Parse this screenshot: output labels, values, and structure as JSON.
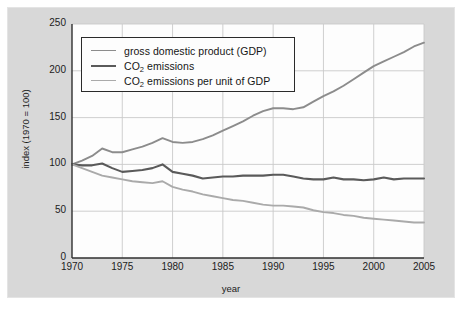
{
  "chart_data": {
    "type": "line",
    "title": "",
    "xlabel": "year",
    "ylabel": "index (1970 = 100)",
    "xlim": [
      1970,
      2005
    ],
    "ylim": [
      0,
      250
    ],
    "xticks": [
      "1970",
      "1975",
      "1980",
      "1985",
      "1990",
      "1995",
      "2000",
      "2005"
    ],
    "yticks": [
      "0",
      "50",
      "100",
      "150",
      "200",
      "250"
    ],
    "grid": true,
    "legend_position": "upper-left-inside",
    "x": [
      1970,
      1971,
      1972,
      1973,
      1974,
      1975,
      1976,
      1977,
      1978,
      1979,
      1980,
      1981,
      1982,
      1983,
      1984,
      1985,
      1986,
      1987,
      1988,
      1989,
      1990,
      1991,
      1992,
      1993,
      1994,
      1995,
      1996,
      1997,
      1998,
      1999,
      2000,
      2001,
      2002,
      2003,
      2004,
      2005
    ],
    "series": [
      {
        "name": "gross domestic product (GDP)",
        "color": "#8c8c8c",
        "values": [
          100,
          104,
          109,
          117,
          113,
          113,
          116,
          119,
          123,
          128,
          124,
          123,
          124,
          127,
          131,
          136,
          141,
          146,
          152,
          157,
          160,
          160,
          159,
          161,
          167,
          173,
          178,
          184,
          191,
          198,
          205,
          210,
          215,
          220,
          226,
          230
        ]
      },
      {
        "name": "CO₂ emissions",
        "color": "#5a5a5a",
        "values": [
          100,
          99,
          99,
          101,
          96,
          92,
          93,
          94,
          96,
          100,
          92,
          90,
          88,
          85,
          86,
          87,
          87,
          88,
          88,
          88,
          89,
          89,
          87,
          85,
          84,
          84,
          86,
          84,
          84,
          83,
          84,
          86,
          84,
          85,
          85,
          85
        ]
      },
      {
        "name": "CO₂ emissions per unit of GDP",
        "color": "#aaaaaa",
        "values": [
          100,
          96,
          92,
          88,
          86,
          84,
          82,
          81,
          80,
          82,
          76,
          73,
          71,
          68,
          66,
          64,
          62,
          61,
          59,
          57,
          56,
          56,
          55,
          54,
          51,
          49,
          48,
          46,
          45,
          43,
          42,
          41,
          40,
          39,
          38,
          38
        ]
      }
    ]
  },
  "legend": {
    "items": [
      {
        "label_pre": "gross domestic product (GDP)",
        "sub": "",
        "label_post": ""
      },
      {
        "label_pre": "CO",
        "sub": "2",
        "label_post": " emissions"
      },
      {
        "label_pre": "CO",
        "sub": "2",
        "label_post": " emissions per unit of GDP"
      }
    ]
  },
  "colors": {
    "gdp": "#8c8c8c",
    "co2": "#5a5a5a",
    "co2_per_gdp": "#aaaaaa",
    "panel_bg": "#d8d8d8",
    "plot_bg": "#fdfdfd",
    "grid": "#c9c9c9",
    "axis": "#2f2f2f"
  }
}
